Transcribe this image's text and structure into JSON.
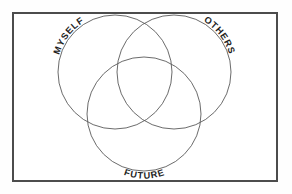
{
  "diagram": {
    "type": "venn-three-circle",
    "title_visible": false,
    "background_color": "#fefefe",
    "frame": {
      "stroke_color": "#4c4c4c",
      "fill_color": "#ffffff",
      "x": 12,
      "y": 12,
      "width": 266,
      "height": 170
    },
    "circle_stroke_color": "#5a5a5a",
    "label_color": "#1d1d1d",
    "circles": [
      {
        "id": "myself",
        "label": "MYSELF",
        "cx": 115,
        "cy": 72,
        "r": 57,
        "label_position": "upper-left-arc"
      },
      {
        "id": "others",
        "label": "OTHERS",
        "cx": 174,
        "cy": 72,
        "r": 57,
        "label_position": "upper-right-arc"
      },
      {
        "id": "future",
        "label": "FUTURE",
        "cx": 144,
        "cy": 114,
        "r": 57,
        "label_position": "bottom-arc"
      }
    ]
  }
}
